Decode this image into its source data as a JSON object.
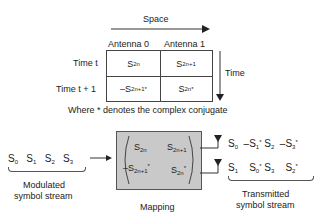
{
  "top_diagram": {
    "space_label": "Space",
    "time_label": "Time",
    "columns": [
      "Antenna 0",
      "Antenna 1"
    ],
    "rows": [
      {
        "label": "Time t",
        "cells": [
          {
            "base": "S",
            "sub": "2n",
            "sup": "",
            "neg": ""
          },
          {
            "base": "S",
            "sub": "2n+1",
            "sup": "",
            "neg": ""
          }
        ]
      },
      {
        "label": "Time t + 1",
        "cells": [
          {
            "base": "S",
            "sub": "2n+1",
            "sup": "*",
            "neg": "–"
          },
          {
            "base": "S",
            "sub": "2n",
            "sup": "*",
            "neg": ""
          }
        ]
      }
    ],
    "note": "Where * denotes the complex conjugate"
  },
  "bottom_diagram": {
    "input_symbols": [
      "S0",
      "S1",
      "S2",
      "S3"
    ],
    "input_label_line1": "Modulated",
    "input_label_line2": "symbol stream",
    "mapping_label": "Mapping",
    "mapping_matrix": [
      [
        "S2n",
        "S2n+1"
      ],
      [
        "-S2n+1*",
        "S2n*"
      ]
    ],
    "antenna0_stream": [
      "S0",
      "-S1*",
      "S2",
      "-S3*"
    ],
    "antenna1_stream": [
      "S1",
      "S0*",
      "S3",
      "S2*"
    ],
    "output_label_line1": "Transmitted",
    "output_label_line2": "symbol stream"
  }
}
